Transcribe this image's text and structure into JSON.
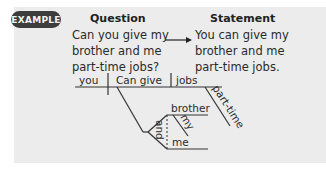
{
  "badge": {
    "label": "EXAMPLE"
  },
  "question": {
    "heading": "Question",
    "lines": [
      "Can you give my",
      "brother and me",
      "part-time jobs?"
    ]
  },
  "statement": {
    "heading": "Statement",
    "lines": [
      "You can give my",
      "brother and me",
      "part-time jobs."
    ]
  },
  "arrow": {
    "icon": "right-arrow-icon"
  },
  "diagram": {
    "subject": "you",
    "verb": "Can give",
    "direct_object": "jobs",
    "modifier_jobs": "part-time",
    "indirect_object_1": "brother",
    "modifier_brother": "my",
    "conjunction": "and",
    "indirect_object_2": "me"
  },
  "colors": {
    "panel_bg": "#ececec",
    "badge_bg": "#3d3d3d",
    "badge_text": "#f4f4f4",
    "line": "#333333"
  }
}
